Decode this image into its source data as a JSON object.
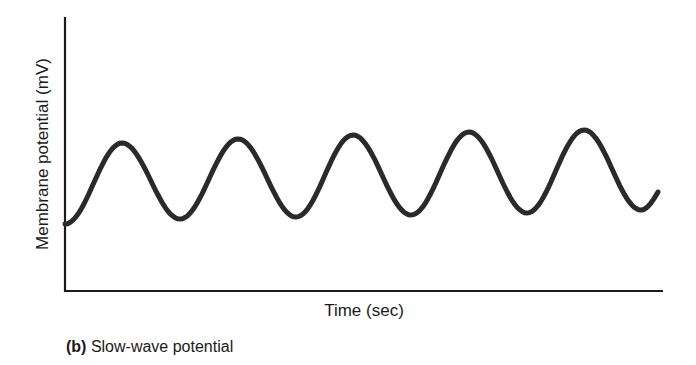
{
  "figure": {
    "caption_tag": "(b)",
    "caption_text": " Slow-wave potential",
    "colors": {
      "line": "#2a2a2a",
      "axis": "#1a1a1a",
      "background": "#ffffff"
    }
  },
  "chart_data": {
    "type": "line",
    "title": "Slow-wave potential",
    "xlabel": "Time (sec)",
    "ylabel": "Membrane potential (mV)",
    "x_ticks": [],
    "y_ticks": [],
    "grid": false,
    "legend": null,
    "series": [
      {
        "name": "membrane potential",
        "points_px": [
          [
            65,
            224
          ],
          [
            122,
            143
          ],
          [
            180,
            219
          ],
          [
            238,
            139
          ],
          [
            296,
            217
          ],
          [
            353,
            135
          ],
          [
            411,
            215
          ],
          [
            469,
            132
          ],
          [
            527,
            213
          ],
          [
            584,
            130
          ],
          [
            641,
            210
          ],
          [
            658,
            192
          ]
        ],
        "peaks": 5,
        "troughs": 6
      }
    ]
  }
}
